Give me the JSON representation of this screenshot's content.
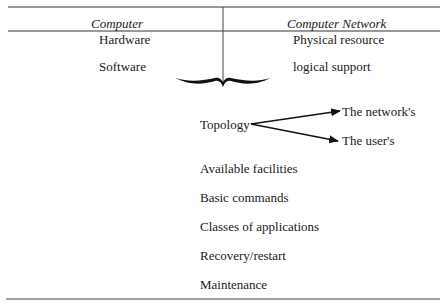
{
  "table": {
    "header": {
      "left": "Computer",
      "right": "Computer Network"
    },
    "rows": [
      {
        "left": "Hardware",
        "right": "Physical resource"
      },
      {
        "left": "Software",
        "right": "logical support"
      }
    ]
  },
  "topology": {
    "label": "Topology",
    "branches": [
      "The network's",
      "The user's"
    ]
  },
  "items": [
    "Available facilities",
    "Basic commands",
    "Classes of applications",
    "Recovery/restart",
    "Maintenance"
  ]
}
